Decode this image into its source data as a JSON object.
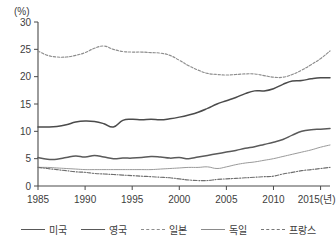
{
  "chart_data": {
    "type": "line",
    "title": "",
    "unit_label": "(%)",
    "xlabel": "(년)",
    "ylabel": "",
    "grid": false,
    "legend_position": "bottom",
    "xlim": [
      1985,
      2016
    ],
    "ylim": [
      0,
      30
    ],
    "xticks": [
      "1985",
      "1990",
      "1995",
      "2000",
      "2005",
      "2010",
      "2015"
    ],
    "xtick_last_suffix": "(년)",
    "yticks": [
      "0",
      "5",
      "10",
      "15",
      "20",
      "25",
      "30"
    ],
    "x": [
      1985,
      1986,
      1987,
      1988,
      1989,
      1990,
      1991,
      1992,
      1993,
      1994,
      1995,
      1996,
      1997,
      1998,
      1999,
      2000,
      2001,
      2002,
      2003,
      2004,
      2005,
      2006,
      2007,
      2008,
      2009,
      2010,
      2011,
      2012,
      2013,
      2014,
      2015,
      2016
    ],
    "series": [
      {
        "name": "미국",
        "style": "solid",
        "color": "#5a5a5a",
        "values": [
          5.2,
          4.9,
          4.9,
          5.2,
          5.5,
          5.3,
          5.6,
          5.3,
          5.0,
          5.1,
          5.1,
          5.2,
          5.4,
          5.3,
          5.1,
          5.2,
          5.0,
          5.3,
          5.6,
          5.9,
          6.2,
          6.5,
          6.9,
          7.2,
          7.6,
          8.0,
          8.5,
          9.3,
          10.0,
          10.3,
          10.4,
          10.5
        ]
      },
      {
        "name": "영국",
        "style": "solid",
        "color": "#4b4b4b",
        "values": [
          10.8,
          10.8,
          10.9,
          11.2,
          11.7,
          11.9,
          11.8,
          11.4,
          10.8,
          12.0,
          12.2,
          12.1,
          12.2,
          12.1,
          12.3,
          12.6,
          13.0,
          13.5,
          14.2,
          15.0,
          15.6,
          16.2,
          16.9,
          17.4,
          17.4,
          17.8,
          18.6,
          19.2,
          19.3,
          19.6,
          19.8,
          19.8
        ]
      },
      {
        "name": "일본",
        "style": "dotted",
        "color": "#8d8d8d",
        "values": [
          24.7,
          23.9,
          23.6,
          23.6,
          23.9,
          24.4,
          25.2,
          25.6,
          25.0,
          24.6,
          24.5,
          24.5,
          24.4,
          24.3,
          23.9,
          23.0,
          22.0,
          21.2,
          20.6,
          20.4,
          20.3,
          20.4,
          20.5,
          20.5,
          20.2,
          19.9,
          19.9,
          20.4,
          21.2,
          22.2,
          23.3,
          24.7
        ]
      },
      {
        "name": "독일",
        "style": "solid-thin",
        "color": "#9a9a9a",
        "values": [
          3.4,
          3.4,
          3.3,
          3.2,
          3.1,
          3.0,
          3.0,
          3.0,
          3.0,
          3.0,
          3.0,
          3.0,
          3.0,
          3.1,
          3.2,
          3.3,
          3.4,
          3.4,
          3.5,
          3.2,
          3.5,
          3.9,
          4.2,
          4.4,
          4.7,
          5.0,
          5.4,
          5.8,
          6.2,
          6.6,
          7.1,
          7.5
        ]
      },
      {
        "name": "프랑스",
        "style": "dashdot",
        "color": "#6f6f6f",
        "values": [
          3.4,
          3.2,
          3.0,
          2.8,
          2.6,
          2.5,
          2.3,
          2.2,
          2.1,
          2.0,
          1.9,
          1.8,
          1.7,
          1.6,
          1.5,
          1.3,
          1.1,
          1.0,
          1.0,
          1.2,
          1.3,
          1.4,
          1.5,
          1.6,
          1.7,
          1.8,
          2.2,
          2.5,
          2.8,
          3.0,
          3.2,
          3.4
        ]
      }
    ]
  },
  "legend": {
    "items": [
      {
        "label": "미국",
        "style": "solid"
      },
      {
        "label": "영국",
        "style": "solid"
      },
      {
        "label": "일본",
        "style": "dotted"
      },
      {
        "label": "독일",
        "style": "solid-thin"
      },
      {
        "label": "프랑스",
        "style": "dashdot"
      }
    ]
  }
}
